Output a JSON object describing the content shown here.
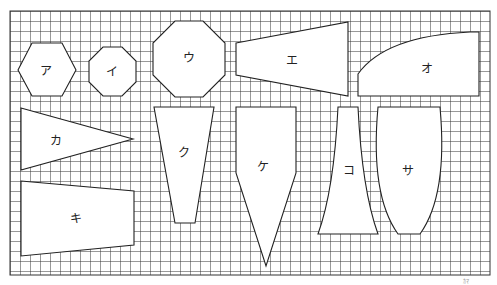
{
  "grid": {
    "x0": 10,
    "y0": 11,
    "x1": 490,
    "y1": 275,
    "cell": 10,
    "line_color": "#333333"
  },
  "shapes": [
    {
      "id": "a",
      "label": "ア",
      "type": "hexagon"
    },
    {
      "id": "i",
      "label": "イ",
      "type": "octagon"
    },
    {
      "id": "u",
      "label": "ウ",
      "type": "octagon"
    },
    {
      "id": "e",
      "label": "エ",
      "type": "trapezoid"
    },
    {
      "id": "o",
      "label": "オ",
      "type": "curved-quadrilateral"
    },
    {
      "id": "ka",
      "label": "カ",
      "type": "triangle"
    },
    {
      "id": "ki",
      "label": "キ",
      "type": "trapezoid"
    },
    {
      "id": "ku",
      "label": "ク",
      "type": "trapezoid"
    },
    {
      "id": "ke",
      "label": "ケ",
      "type": "pentagon"
    },
    {
      "id": "ko",
      "label": "コ",
      "type": "curved-trapezoid"
    },
    {
      "id": "sa",
      "label": "サ",
      "type": "curved-trapezoid"
    }
  ],
  "footnote": "ｶﾏ"
}
